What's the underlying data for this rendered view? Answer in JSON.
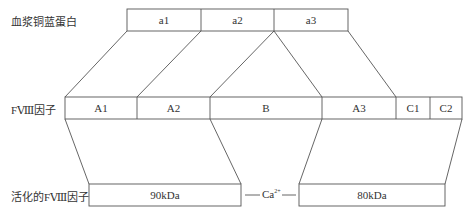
{
  "colors": {
    "line": "#555555",
    "text": "#333333",
    "background": "#ffffff"
  },
  "rows": {
    "ceruloplasmin": {
      "label": "血浆铜蓝蛋白",
      "segments": [
        {
          "label": "a1",
          "x1": 127,
          "x2": 201
        },
        {
          "label": "a2",
          "x1": 201,
          "x2": 274
        },
        {
          "label": "a3",
          "x1": 274,
          "x2": 348
        }
      ]
    },
    "factor_viii": {
      "label": "FⅧ因子",
      "segments": [
        {
          "label": "A1",
          "x1": 65,
          "x2": 137
        },
        {
          "label": "A2",
          "x1": 137,
          "x2": 210
        },
        {
          "label": "B",
          "x1": 210,
          "x2": 322
        },
        {
          "label": "A3",
          "x1": 322,
          "x2": 396
        },
        {
          "label": "C1",
          "x1": 396,
          "x2": 430
        },
        {
          "label": "C2",
          "x1": 430,
          "x2": 462
        }
      ]
    },
    "activated_factor_viii": {
      "label": "活化的FⅧ因子",
      "heavy_chain": {
        "label": "90kDa",
        "x1": 89,
        "x2": 241
      },
      "light_chain": {
        "label": "80kDa",
        "x1": 299,
        "x2": 445
      },
      "linker": {
        "ion": "Ca",
        "charge": "2+"
      }
    }
  }
}
